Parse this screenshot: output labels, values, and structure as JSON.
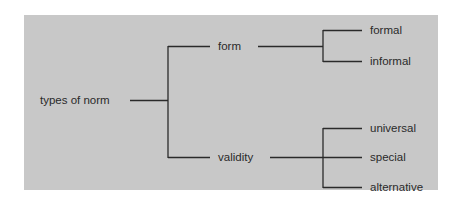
{
  "diagram": {
    "type": "tree",
    "background_color": "#c8c8c8",
    "line_color": "#2a2a2a",
    "root": {
      "label": "types of norm",
      "children": [
        {
          "label": "form",
          "children": [
            {
              "label": "formal"
            },
            {
              "label": "informal"
            }
          ]
        },
        {
          "label": "validity",
          "children": [
            {
              "label": "universal"
            },
            {
              "label": "special"
            },
            {
              "label": "alternative"
            }
          ]
        }
      ]
    }
  }
}
